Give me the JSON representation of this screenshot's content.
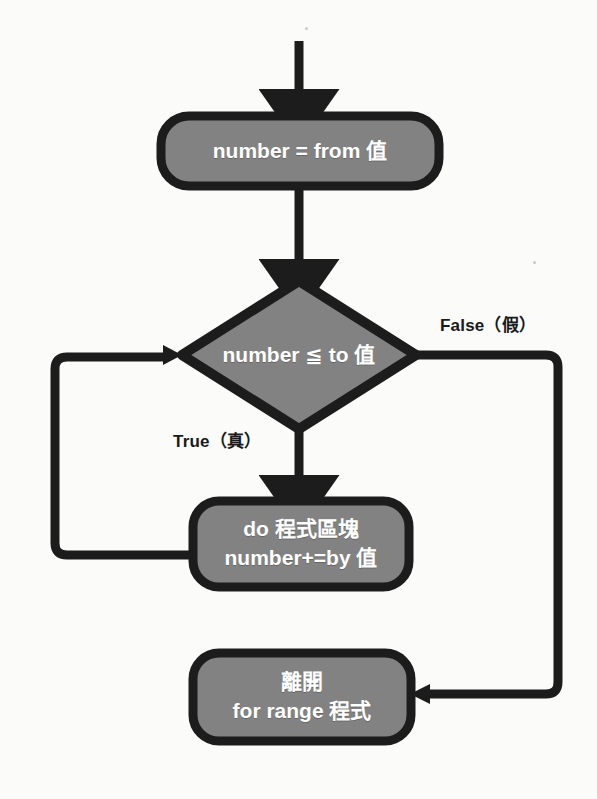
{
  "diagram": {
    "type": "flowchart",
    "colors": {
      "node_fill": "#828282",
      "node_stroke": "#1c1c1c",
      "node_text": "#ffffff",
      "edge": "#1c1c1c",
      "background": "#fbfbfa",
      "label_text": "#1a1a1a"
    },
    "nodes": [
      {
        "id": "init",
        "shape": "rounded-rect",
        "lines": [
          "number = from 值"
        ]
      },
      {
        "id": "condition",
        "shape": "diamond",
        "lines": [
          "number ≦ to 值"
        ]
      },
      {
        "id": "body",
        "shape": "rounded-rect",
        "lines": [
          "do 程式區塊",
          "number+=by 值"
        ]
      },
      {
        "id": "exit",
        "shape": "rounded-rect",
        "lines": [
          "離開",
          "for range 程式"
        ]
      }
    ],
    "edges": [
      {
        "id": "entry",
        "label": ""
      },
      {
        "id": "init-to-condition",
        "label": ""
      },
      {
        "id": "condition-false",
        "label": "False（假）"
      },
      {
        "id": "condition-true",
        "label": "True（真）"
      },
      {
        "id": "body-loop-back",
        "label": ""
      },
      {
        "id": "false-to-exit",
        "label": ""
      }
    ]
  }
}
